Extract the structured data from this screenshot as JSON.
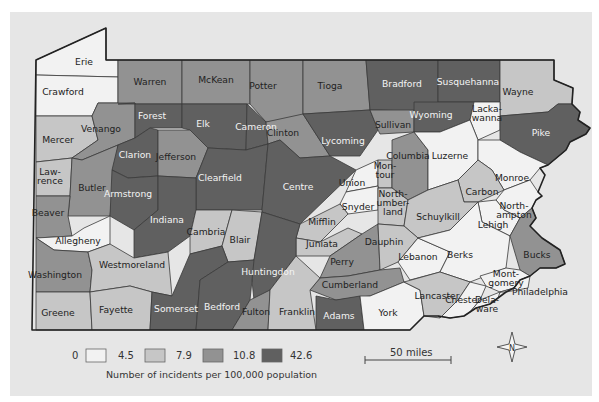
{
  "map": {
    "title": "Pennsylvania county incident rates",
    "legend": {
      "breaks": [
        "0",
        "4.5",
        "7.9",
        "10.8",
        "42.6"
      ],
      "caption": "Number of incidents per 100,000 population",
      "classes": [
        {
          "range": "0–4.5",
          "color": "#f2f2f2"
        },
        {
          "range": "4.5–7.9",
          "color": "#c6c6c6"
        },
        {
          "range": "7.9–10.8",
          "color": "#929292"
        },
        {
          "range": "10.8–42.6",
          "color": "#606060"
        }
      ]
    },
    "scale_bar": {
      "label": "50 miles"
    },
    "compass": {
      "label": "N"
    },
    "counties": [
      {
        "name": "Erie",
        "class": 0
      },
      {
        "name": "Crawford",
        "class": 0
      },
      {
        "name": "Warren",
        "class": 2
      },
      {
        "name": "McKean",
        "class": 2
      },
      {
        "name": "Potter",
        "class": 2
      },
      {
        "name": "Tioga",
        "class": 2
      },
      {
        "name": "Bradford",
        "class": 3
      },
      {
        "name": "Susquehanna",
        "class": 3
      },
      {
        "name": "Wayne",
        "class": 1
      },
      {
        "name": "Mercer",
        "class": 1
      },
      {
        "name": "Venango",
        "class": 2
      },
      {
        "name": "Forest",
        "class": 3
      },
      {
        "name": "Elk",
        "class": 3
      },
      {
        "name": "Cameron",
        "class": 3
      },
      {
        "name": "Clinton",
        "class": 2
      },
      {
        "name": "Lycoming",
        "class": 3
      },
      {
        "name": "Sullivan",
        "class": 2
      },
      {
        "name": "Wyoming",
        "class": 3
      },
      {
        "name": "Lackawanna",
        "label": "Lacka-\nwanna",
        "class": 0
      },
      {
        "name": "Pike",
        "class": 3
      },
      {
        "name": "Lawrence",
        "label": "Law-\nrence",
        "class": 1
      },
      {
        "name": "Butler",
        "class": 2
      },
      {
        "name": "Clarion",
        "class": 3
      },
      {
        "name": "Jefferson",
        "class": 2
      },
      {
        "name": "Armstrong",
        "class": 3
      },
      {
        "name": "Clearfield",
        "class": 3
      },
      {
        "name": "Centre",
        "class": 3
      },
      {
        "name": "Union",
        "class": 0
      },
      {
        "name": "Montour",
        "label": "Mon-\ntour",
        "class": 1
      },
      {
        "name": "Columbia",
        "class": 2
      },
      {
        "name": "Luzerne",
        "class": 0
      },
      {
        "name": "Monroe",
        "class": 0
      },
      {
        "name": "Beaver",
        "class": 2
      },
      {
        "name": "Indiana",
        "class": 3
      },
      {
        "name": "Snyder",
        "class": 0
      },
      {
        "name": "Northumberland",
        "label": "North-\number-\nland",
        "class": 1
      },
      {
        "name": "Carbon",
        "class": 1
      },
      {
        "name": "Allegheny",
        "class": 0
      },
      {
        "name": "Cambria",
        "class": 1
      },
      {
        "name": "Blair",
        "class": 1
      },
      {
        "name": "Mifflin",
        "class": 1
      },
      {
        "name": "Juniata",
        "class": 1
      },
      {
        "name": "Schuylkill",
        "class": 1
      },
      {
        "name": "Northampton",
        "label": "North-\nampton",
        "class": 0
      },
      {
        "name": "Lehigh",
        "class": 0
      },
      {
        "name": "Washington",
        "class": 2
      },
      {
        "name": "Westmoreland",
        "class": 1
      },
      {
        "name": "Huntingdon",
        "class": 3
      },
      {
        "name": "Perry",
        "class": 2
      },
      {
        "name": "Dauphin",
        "class": 1
      },
      {
        "name": "Lebanon",
        "class": 0
      },
      {
        "name": "Berks",
        "class": 0
      },
      {
        "name": "Bucks",
        "class": 2
      },
      {
        "name": "Cumberland",
        "class": 2
      },
      {
        "name": "Montgomery",
        "label": "Mont-\ngomery",
        "class": 0
      },
      {
        "name": "Greene",
        "class": 1
      },
      {
        "name": "Fayette",
        "class": 1
      },
      {
        "name": "Somerset",
        "class": 3
      },
      {
        "name": "Bedford",
        "class": 3
      },
      {
        "name": "Fulton",
        "class": 2
      },
      {
        "name": "Franklin",
        "class": 1
      },
      {
        "name": "Adams",
        "class": 3
      },
      {
        "name": "York",
        "class": 0
      },
      {
        "name": "Lancaster",
        "class": 1
      },
      {
        "name": "Chester",
        "class": 0
      },
      {
        "name": "Delaware",
        "label": "Dela-\nware",
        "class": 0
      },
      {
        "name": "Philadelphia",
        "class": 0
      }
    ]
  }
}
